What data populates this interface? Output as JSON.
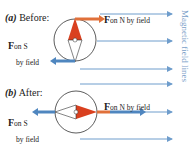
{
  "panel_a": {
    "prefix": "(",
    "letter": "a",
    "suffix": ") Before:",
    "force_n": {
      "symbol": "F",
      "sub": "on N by field"
    },
    "force_s": {
      "symbol": "F",
      "sub1": "on S",
      "sub2": "by field"
    }
  },
  "panel_b": {
    "prefix": "(",
    "letter": "b",
    "suffix": ") After:",
    "force_n": {
      "symbol": "F",
      "sub": "on N by field"
    },
    "force_s": {
      "symbol": "F",
      "sub1": "on S",
      "sub2": "by field"
    }
  },
  "side_label": "Magnetic field lines",
  "colors": {
    "field_line": "#6f9dcc",
    "north": "#d9401f",
    "force_s": "#4f86bf",
    "force_n": "#e0703a"
  }
}
